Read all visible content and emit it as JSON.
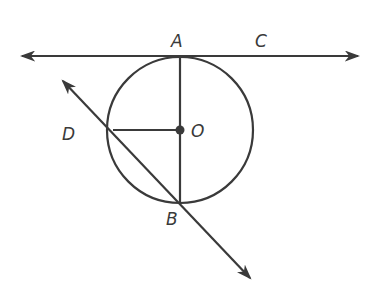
{
  "diagram": {
    "type": "geometry",
    "colors": {
      "ink": "#3a3a3a",
      "background": "#ffffff"
    },
    "circle": {
      "center_label": "O",
      "cx": 180,
      "cy": 130,
      "r": 73
    },
    "points": [
      {
        "id": "A",
        "label": "A",
        "x": 180,
        "y": 57,
        "label_x": 171,
        "label_y": 47
      },
      {
        "id": "C",
        "label": "C",
        "x": 262,
        "y": 57,
        "label_x": 255,
        "label_y": 47
      },
      {
        "id": "D",
        "label": "D",
        "x": 113,
        "y": 130,
        "label_x": 62,
        "label_y": 140
      },
      {
        "id": "O",
        "label": "O",
        "x": 180,
        "y": 130,
        "label_x": 191,
        "label_y": 137
      },
      {
        "id": "B",
        "label": "B",
        "x": 180,
        "y": 203,
        "label_x": 166,
        "label_y": 225
      }
    ],
    "lines": [
      {
        "name": "line-AC",
        "type": "line",
        "x1": 22,
        "y1": 56,
        "x2": 358,
        "y2": 56,
        "arrows": "both"
      },
      {
        "name": "ray-DB",
        "type": "line",
        "x1": 63,
        "y1": 81,
        "x2": 250,
        "y2": 278,
        "arrows": "both"
      },
      {
        "name": "segment-AB",
        "type": "segment",
        "x1": 180,
        "y1": 57,
        "x2": 180,
        "y2": 203
      },
      {
        "name": "segment-DO",
        "type": "segment",
        "x1": 113,
        "y1": 130,
        "x2": 180,
        "y2": 130
      }
    ]
  }
}
